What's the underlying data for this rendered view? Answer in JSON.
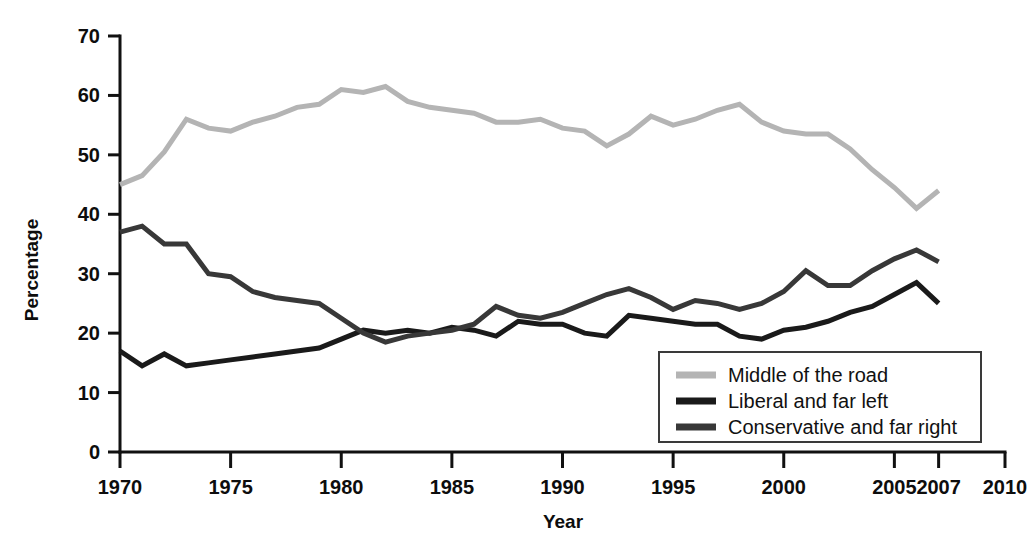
{
  "chart_data": {
    "type": "line",
    "title": "",
    "xlabel": "Year",
    "ylabel": "Percentage",
    "xlim": [
      1970,
      2010
    ],
    "ylim": [
      0,
      70
    ],
    "xticks": [
      1970,
      1975,
      1980,
      1985,
      1990,
      1995,
      2000,
      2005,
      2007,
      2010
    ],
    "xtick_labels": [
      "1970",
      "1975",
      "1980",
      "1985",
      "1990",
      "1995",
      "2000",
      "2005",
      "2007",
      "2010"
    ],
    "yticks": [
      0,
      10,
      20,
      30,
      40,
      50,
      60,
      70
    ],
    "ytick_labels": [
      "0",
      "10",
      "20",
      "30",
      "40",
      "50",
      "60",
      "70"
    ],
    "grid": false,
    "legend_position": "lower right",
    "x": [
      1970,
      1971,
      1972,
      1973,
      1974,
      1975,
      1976,
      1977,
      1978,
      1979,
      1980,
      1981,
      1982,
      1983,
      1984,
      1985,
      1986,
      1987,
      1988,
      1989,
      1990,
      1991,
      1992,
      1993,
      1994,
      1995,
      1996,
      1997,
      1998,
      1999,
      2000,
      2001,
      2002,
      2003,
      2004,
      2005,
      2006,
      2007
    ],
    "series": [
      {
        "name": "Middle of the road",
        "color": "#b4b4b4",
        "width": 5,
        "values": [
          45.0,
          46.5,
          50.5,
          56.0,
          54.5,
          54.0,
          55.5,
          56.5,
          58.0,
          58.5,
          61.0,
          60.5,
          61.5,
          59.0,
          58.0,
          57.5,
          57.0,
          55.5,
          55.5,
          56.0,
          54.5,
          54.0,
          51.5,
          53.5,
          56.5,
          55.0,
          56.0,
          57.5,
          58.5,
          55.5,
          54.0,
          53.5,
          53.5,
          51.0,
          47.5,
          44.5,
          41.0,
          44.0
        ]
      },
      {
        "name": "Liberal and far left",
        "color": "#1a1a1a",
        "width": 5,
        "values": [
          17.0,
          14.5,
          16.5,
          14.5,
          15.0,
          15.5,
          16.0,
          16.5,
          17.0,
          17.5,
          19.0,
          20.5,
          20.0,
          20.5,
          20.0,
          21.0,
          20.5,
          19.5,
          22.0,
          21.5,
          21.5,
          20.0,
          19.5,
          23.0,
          22.5,
          22.0,
          21.5,
          21.5,
          19.5,
          19.0,
          20.5,
          21.0,
          22.0,
          23.5,
          24.5,
          26.5,
          28.5,
          25.0
        ]
      },
      {
        "name": "Conservative and far right",
        "color": "#383838",
        "width": 5,
        "values": [
          37.0,
          38.0,
          35.0,
          35.0,
          30.0,
          29.5,
          27.0,
          26.0,
          25.5,
          25.0,
          22.5,
          20.0,
          18.5,
          19.5,
          20.0,
          20.5,
          21.5,
          24.5,
          23.0,
          22.5,
          23.5,
          25.0,
          26.5,
          27.5,
          26.0,
          24.0,
          25.5,
          25.0,
          24.0,
          25.0,
          27.0,
          30.5,
          28.0,
          28.0,
          30.5,
          32.5,
          34.0,
          32.0
        ]
      }
    ]
  },
  "legend": {
    "entries": [
      {
        "label": "Middle of the road"
      },
      {
        "label": "Liberal and far left"
      },
      {
        "label": "Conservative and far right"
      }
    ]
  }
}
